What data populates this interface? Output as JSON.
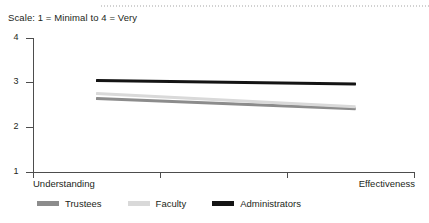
{
  "scale_note": "Scale: 1 = Minimal to 4 = Very",
  "colors": {
    "administrators": "#141414",
    "faculty": "#d9d9d9",
    "trustees": "#8c8c8c",
    "axis": "#4d4d4d",
    "text": "#231f20",
    "top_rule": "#c9c9c9"
  },
  "axis": {
    "y_ticks": [
      {
        "label": "4",
        "value": 4
      },
      {
        "label": "3",
        "value": 3
      },
      {
        "label": "2",
        "value": 2
      },
      {
        "label": "1",
        "value": 1
      }
    ],
    "x_labels": {
      "left": "Understanding",
      "right": "Effectiveness"
    }
  },
  "legend": {
    "items": [
      {
        "label": "Trustees",
        "color": "#8c8c8c"
      },
      {
        "label": "Faculty",
        "color": "#d9d9d9"
      },
      {
        "label": "Administrators",
        "color": "#141414"
      }
    ]
  },
  "chart_data": {
    "type": "line",
    "title": "",
    "subtitle": "Scale: 1 = Minimal to 4 = Very",
    "xlabel": "",
    "ylabel": "",
    "categories": [
      "Understanding",
      "Effectiveness"
    ],
    "x": [
      0,
      1
    ],
    "ylim": [
      1,
      4
    ],
    "yticks": [
      1,
      2,
      3,
      4
    ],
    "grid": false,
    "legend_position": "bottom",
    "series": [
      {
        "name": "Trustees",
        "color": "#8c8c8c",
        "values": [
          2.65,
          2.42
        ]
      },
      {
        "name": "Faculty",
        "color": "#d9d9d9",
        "values": [
          2.75,
          2.45
        ]
      },
      {
        "name": "Administrators",
        "color": "#141414",
        "values": [
          3.05,
          2.97
        ]
      }
    ],
    "annotations": [
      "Scale: 1 = Minimal to 4 = Very"
    ]
  }
}
